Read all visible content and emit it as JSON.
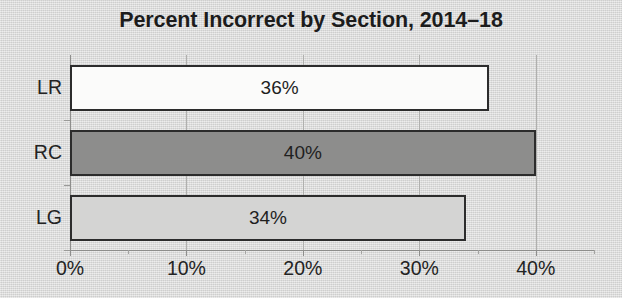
{
  "chart_data": {
    "type": "bar",
    "orientation": "horizontal",
    "title": "Percent Incorrect by Section, 2014–18",
    "xlabel": "",
    "ylabel": "",
    "categories": [
      "LR",
      "RC",
      "LG"
    ],
    "values": [
      36,
      34,
      40
    ],
    "value_labels": [
      "36%",
      "40%",
      "34%"
    ],
    "bars": [
      {
        "category": "LR",
        "value": 36,
        "label": "36%",
        "fill": "#fbfbfa",
        "stroke": "#2c2c2c"
      },
      {
        "category": "RC",
        "value": 40,
        "label": "40%",
        "fill": "#8d8d8c",
        "stroke": "#2c2c2c"
      },
      {
        "category": "LG",
        "value": 34,
        "label": "34%",
        "fill": "#d4d4d3",
        "stroke": "#2c2c2c"
      }
    ],
    "xlim": [
      0,
      45
    ],
    "xticks": [
      0,
      10,
      20,
      30,
      40
    ],
    "xtick_labels": [
      "0%",
      "10%",
      "20%",
      "30%",
      "40%"
    ],
    "xtick_minor": [
      5,
      15,
      25,
      35,
      45
    ],
    "yticks": [
      "LR",
      "RC",
      "LG"
    ],
    "grid": true,
    "grid_axis": "x",
    "legend": false,
    "legend_position": "none",
    "background_color": "#dcdcdb",
    "title_color": "#1c1c1c",
    "axis_color": "#8e8e8c",
    "gridline_color": "#b0b0ae",
    "text_color": "#232323"
  }
}
